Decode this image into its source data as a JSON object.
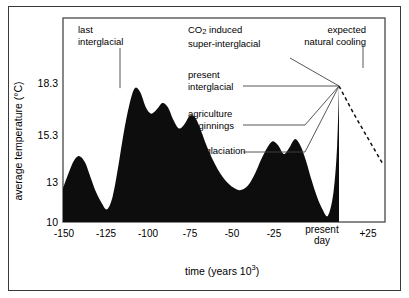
{
  "chart_data": {
    "type": "area",
    "title": "",
    "xlabel": "time (years 10³)",
    "ylabel": "average temperature (°C)",
    "x_ticks": [
      "-150",
      "-125",
      "-100",
      "-75",
      "-50",
      "-25",
      "present\nday",
      "+25"
    ],
    "x_tick_values": [
      -150,
      -125,
      -100,
      -75,
      -50,
      -25,
      0,
      25
    ],
    "y_ticks": [
      "18.3",
      "15.3",
      "13",
      "10"
    ],
    "y_tick_values": [
      18.3,
      15.3,
      13,
      10
    ],
    "xlim": [
      -150,
      25
    ],
    "ylim": [
      10,
      19.6
    ],
    "grid": false,
    "legend": "none",
    "series": [
      {
        "name": "average temperature",
        "fill": "#0d0d0d",
        "x": [
          -150,
          -147,
          -144,
          -141,
          -138,
          -135,
          -132,
          -129,
          -126,
          -123,
          -120,
          -117,
          -114,
          -111,
          -108,
          -105,
          -102,
          -99,
          -96,
          -93,
          -90,
          -87,
          -84,
          -81,
          -78,
          -75,
          -72,
          -69,
          -66,
          -63,
          -60,
          -57,
          -54,
          -51,
          -48,
          -45,
          -42,
          -39,
          -36,
          -33,
          -30,
          -27,
          -24,
          -21,
          -18,
          -15,
          -12,
          -9,
          -6,
          -3,
          -1,
          0
        ],
        "values": [
          11.6,
          12.3,
          12.9,
          13.1,
          12.8,
          12.1,
          11.4,
          10.9,
          10.6,
          11.2,
          12.6,
          14.2,
          15.5,
          16.3,
          16.1,
          15.4,
          15.1,
          15.3,
          15.6,
          15.4,
          14.8,
          14.4,
          14.6,
          15.0,
          14.9,
          14.3,
          13.6,
          13.0,
          12.5,
          12.1,
          11.8,
          11.6,
          11.5,
          11.6,
          11.9,
          12.4,
          13.0,
          13.5,
          13.8,
          13.6,
          13.2,
          13.5,
          13.9,
          13.6,
          12.9,
          12.0,
          11.2,
          10.6,
          10.3,
          11.4,
          13.6,
          16.4
        ]
      }
    ],
    "projection": {
      "name": "expected natural cooling",
      "style": "dashed",
      "x": [
        0,
        8,
        16,
        24
      ],
      "values": [
        16.4,
        15.1,
        13.9,
        12.7
      ]
    },
    "annotations": [
      {
        "id": "last-interglacial",
        "text": "last\ninterglacial",
        "pointer": "vertical-line-to-peak"
      },
      {
        "id": "co2-induced",
        "text": "CO₂ induced\nsuper-interglacial",
        "pointer": "none"
      },
      {
        "id": "expected-natural-cooling",
        "text": "expected\nnatural cooling",
        "pointer": "short-vertical-tick"
      },
      {
        "id": "present-interglacial",
        "text": "present\ninterglacial",
        "pointer": "leader-line"
      },
      {
        "id": "agriculture-beginnings",
        "text": "agriculture\nbeginnings",
        "pointer": "leader-line"
      },
      {
        "id": "last-glaciation",
        "text": "last glaciation",
        "pointer": "leader-line"
      }
    ]
  },
  "annotation_labels": {
    "last_interglacial_l1": "last",
    "last_interglacial_l2": "interglacial",
    "co2_prefix": "CO",
    "co2_sub": "2",
    "co2_suffix": " induced",
    "co2_l2": "super-interglacial",
    "cooling_l1": "expected",
    "cooling_l2": "natural cooling",
    "present_l1": "present",
    "present_l2": "interglacial",
    "agriculture_l1": "agriculture",
    "agriculture_l2": "beginnings",
    "last_glaciation": "last glaciation"
  },
  "axes": {
    "y_title": "average temperature (°C)",
    "x_title_prefix": "time (years 10",
    "x_title_sup": "3",
    "x_title_suffix": ")",
    "y_18_3": "18.3",
    "y_15_3": "15.3",
    "y_13": "13",
    "y_10": "10",
    "x_150": "-150",
    "x_125": "-125",
    "x_100": "-100",
    "x_75": "-75",
    "x_50": "-50",
    "x_25": "-25",
    "x_present_l1": "present",
    "x_present_l2": "day",
    "x_plus25": "+25"
  },
  "colors": {
    "fill": "#0d0d0d",
    "frame": "#555555",
    "outer_frame": "#3a3a3a",
    "background": "#ffffff"
  }
}
